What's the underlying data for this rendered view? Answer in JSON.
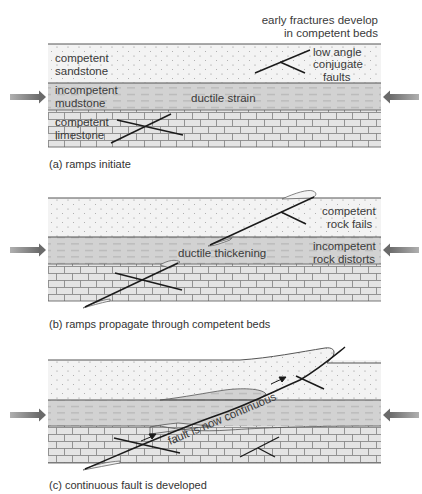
{
  "colors": {
    "sandstone": "#f3f3f3",
    "mudstone": "#d2d2d2",
    "limestone": "#e4e4e4",
    "brick_line": "#8a8a8a",
    "fault_line": "#1a1a1a",
    "bed_boundary": "#555555",
    "arrow": "#7a7a7a"
  },
  "panels": [
    {
      "id": "a",
      "caption": "(a) ramps initiate",
      "top_note": [
        "early fractures develop",
        "in competent beds"
      ],
      "labels": {
        "sandstone": [
          "competent",
          "sandstone"
        ],
        "mudstone": [
          "incompetent",
          "mudstone"
        ],
        "limestone": [
          "competent",
          "limestone"
        ],
        "middle": "ductile strain",
        "fault_note": [
          "low angle",
          "conjugate",
          "faults"
        ]
      }
    },
    {
      "id": "b",
      "caption": "(b) ramps propagate through competent beds",
      "labels": {
        "middle": "ductile thickening",
        "sandstone_right": [
          "competent",
          "rock fails"
        ],
        "mudstone_right": [
          "incompetent",
          "rock distorts"
        ]
      }
    },
    {
      "id": "c",
      "caption": "(c) continuous fault is developed",
      "labels": {
        "fault": "fault is now continuous"
      }
    }
  ]
}
